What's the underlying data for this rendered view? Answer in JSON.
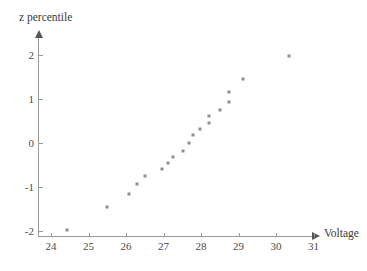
{
  "chart_data": {
    "type": "scatter",
    "title": "",
    "xlabel": "Voltage",
    "ylabel": "z percentile",
    "xlim": [
      23.6,
      31.4
    ],
    "ylim": [
      -2.3,
      2.3
    ],
    "grid": false,
    "legend": "none",
    "xticks": [
      24,
      25,
      26,
      27,
      28,
      29,
      30,
      31
    ],
    "yticks": [
      2,
      1,
      0,
      -1,
      -2
    ],
    "xtick_labels": [
      "24",
      "25",
      "26",
      "27",
      "28",
      "29",
      "30",
      "31"
    ],
    "ytick_labels": [
      "2",
      "1",
      "0",
      "-1",
      "-2"
    ],
    "marker": {
      "shape": "square",
      "color": "#8d8d94",
      "size_px": 3
    },
    "axis_color": "#9a9a9a",
    "series": [
      {
        "name": "normal probability plot",
        "x": [
          24.43,
          25.49,
          26.08,
          26.29,
          26.51,
          26.96,
          27.12,
          27.25,
          27.52,
          27.68,
          27.79,
          27.97,
          28.21,
          28.21,
          28.51,
          28.75,
          28.75,
          29.12,
          30.35
        ],
        "y": [
          -1.98,
          -1.45,
          -1.16,
          -0.93,
          -0.75,
          -0.59,
          -0.45,
          -0.32,
          -0.18,
          0.0,
          0.18,
          0.32,
          0.45,
          0.61,
          0.75,
          0.93,
          1.16,
          1.45,
          1.98
        ]
      }
    ]
  },
  "axes": {
    "x_title": "Voltage",
    "y_title": "z percentile"
  }
}
